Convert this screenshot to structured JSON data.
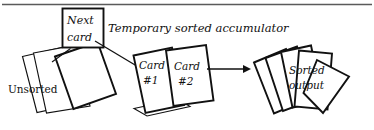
{
  "figure": {
    "caption": "Temporary sorted accumulator",
    "background_color": "#ffffff",
    "ink_color": "#111111",
    "rule_color": "#5a5a5a"
  },
  "labels": {
    "next_card_line1": "Next",
    "next_card_line2": "card",
    "unsorted": "Unsorted",
    "card1_line1": "Card",
    "card1_line2": "#1",
    "card2_line1": "Card",
    "card2_line2": "#2",
    "sorted_line1": "Sorted",
    "sorted_line2": "output",
    "accumulator": "Temporary sorted accumulator"
  },
  "groups": [
    {
      "name": "unsorted-pile",
      "label": "Unsorted",
      "card_count": 3
    },
    {
      "name": "accumulator-pile",
      "label": "Card #1 / Card #2",
      "card_count": 3
    },
    {
      "name": "sorted-pile",
      "label": "Sorted output",
      "card_count": 5
    }
  ],
  "connectors": [
    {
      "name": "next-card-leader",
      "from": "next-card-box",
      "to": "unsorted-pile-top"
    },
    {
      "name": "insertion-arrow",
      "from": "next-card-box",
      "to": "accumulator-pile",
      "arrowhead": true
    },
    {
      "name": "transfer-arrow",
      "from": "accumulator-pile",
      "to": "sorted-pile",
      "arrowhead": true
    }
  ]
}
